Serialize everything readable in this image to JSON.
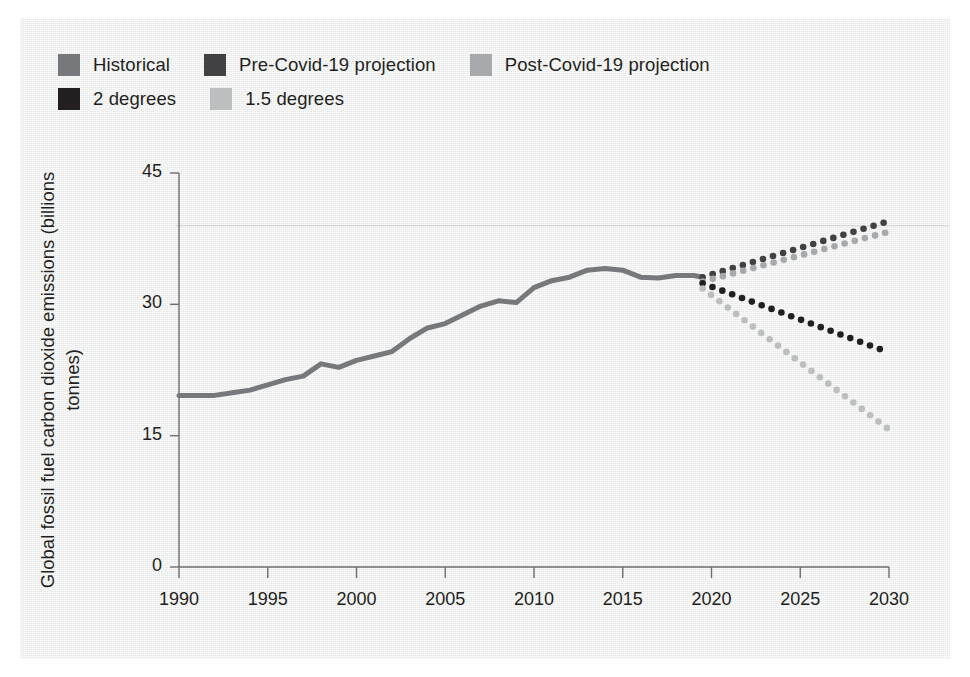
{
  "figure": {
    "background_color": "#ffffff",
    "panel_color": "#edeeee",
    "axis_color": "#6d6e71",
    "text_color": "#231f20"
  },
  "legend": {
    "rows": [
      [
        {
          "label": "Historical",
          "color": "#77787b",
          "swatch_name": "legend-swatch-historical"
        },
        {
          "label": "Pre-Covid-19 projection",
          "color": "#414042",
          "swatch_name": "legend-swatch-pre-covid"
        },
        {
          "label": "Post-Covid-19 projection",
          "color": "#a7a9ac",
          "swatch_name": "legend-swatch-post-covid"
        }
      ],
      [
        {
          "label": "2 degrees",
          "color": "#231f20",
          "swatch_name": "legend-swatch-2-degrees"
        },
        {
          "label": "1.5 degrees",
          "color": "#bcbec0",
          "swatch_name": "legend-swatch-1-5-degrees"
        }
      ]
    ]
  },
  "axes": {
    "y_label": "Global fossil fuel carbon dioxide emissions (billions tonnes)",
    "y_ticks": [
      "0",
      "15",
      "30",
      "45"
    ],
    "y_tick_values": [
      0,
      15,
      30,
      45
    ],
    "x_ticks": [
      "1990",
      "1995",
      "2000",
      "2005",
      "2010",
      "2015",
      "2020",
      "2025",
      "2030"
    ],
    "x_tick_values": [
      1990,
      1995,
      2000,
      2005,
      2010,
      2015,
      2020,
      2025,
      2030
    ],
    "gridline_value": 39
  },
  "chart_data": {
    "type": "line",
    "title": "",
    "subtitle": "",
    "xlabel": "",
    "ylabel": "Global fossil fuel carbon dioxide emissions (billions tonnes)",
    "xlim": [
      1989,
      2031
    ],
    "ylim": [
      0,
      45
    ],
    "grid": true,
    "legend_position": "top-left",
    "series": [
      {
        "name": "Historical",
        "style": "solid",
        "color": "#77787b",
        "x": [
          1990,
          1991,
          1992,
          1993,
          1994,
          1995,
          1996,
          1997,
          1998,
          1999,
          2000,
          2001,
          2002,
          2003,
          2004,
          2005,
          2006,
          2007,
          2008,
          2009,
          2010,
          2011,
          2012,
          2013,
          2014,
          2015,
          2016,
          2017,
          2018,
          2019,
          2019.5
        ],
        "values": [
          19.6,
          19.6,
          19.6,
          19.9,
          20.2,
          20.8,
          21.4,
          21.8,
          23.2,
          22.8,
          23.6,
          24.1,
          24.6,
          26.1,
          27.3,
          27.8,
          28.8,
          29.8,
          30.4,
          30.2,
          31.9,
          32.7,
          33.1,
          33.9,
          34.1,
          33.9,
          33.1,
          33.0,
          33.3,
          33.3,
          33.1
        ]
      },
      {
        "name": "Pre-Covid-19 projection",
        "style": "dotted",
        "color": "#414042",
        "x": [
          2019.5,
          2030
        ],
        "values": [
          33.1,
          39.5
        ]
      },
      {
        "name": "Post-Covid-19 projection",
        "style": "dotted",
        "color": "#a7a9ac",
        "x": [
          2019.5,
          2030
        ],
        "values": [
          32.6,
          38.3
        ]
      },
      {
        "name": "2 degrees",
        "style": "dotted",
        "color": "#231f20",
        "x": [
          2019.5,
          2030
        ],
        "values": [
          32.4,
          24.5
        ]
      },
      {
        "name": "1.5 degrees",
        "style": "dotted",
        "color": "#bcbec0",
        "x": [
          2019.5,
          2030
        ],
        "values": [
          31.8,
          15.7
        ]
      }
    ]
  }
}
